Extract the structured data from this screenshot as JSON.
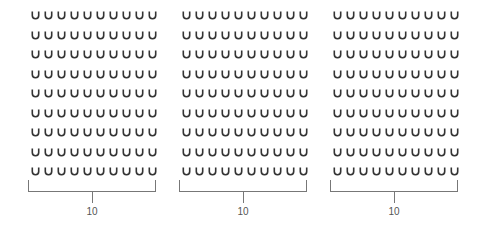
{
  "figure": {
    "shape": "u-icon",
    "color": "#333333",
    "bracket_color": "#777777",
    "groups": [
      {
        "rows": 9,
        "columns": 10,
        "bracket_label": "10",
        "left": 31,
        "bracket_left": 28,
        "bracket_right": 156
      },
      {
        "rows": 9,
        "columns": 10,
        "bracket_label": "10",
        "left": 182,
        "bracket_left": 179,
        "bracket_right": 307
      },
      {
        "rows": 9,
        "columns": 10,
        "bracket_label": "10",
        "left": 333,
        "bracket_left": 330,
        "bracket_right": 458
      }
    ]
  }
}
